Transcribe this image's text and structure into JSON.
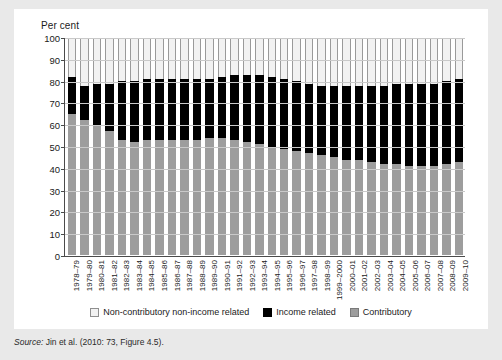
{
  "axis": {
    "y_title": "Per cent",
    "y_ticks": [
      100,
      90,
      80,
      70,
      60,
      50,
      40,
      30,
      20,
      10,
      0
    ]
  },
  "legend": {
    "items": [
      {
        "label": "Non-contributory non-income related",
        "swatch": "white",
        "color": "#f2f2f2"
      },
      {
        "label": "Income related",
        "swatch": "black",
        "color": "#000000"
      },
      {
        "label": "Contributory",
        "swatch": "grey",
        "color": "#9d9d9d"
      }
    ]
  },
  "source": {
    "prefix": "Source:",
    "text": " Jin et al. (2010: 73, Figure 4.5)."
  },
  "chart_data": {
    "type": "bar",
    "stacked": true,
    "title": "",
    "subtitle": "",
    "xlabel": "",
    "ylabel": "Per cent",
    "ylim": [
      0,
      100
    ],
    "grid": true,
    "legend_position": "bottom",
    "categories": [
      "1978–79",
      "1979–80",
      "1980–81",
      "1981–82",
      "1982–83",
      "1983–84",
      "1984–85",
      "1985–86",
      "1986–87",
      "1987–88",
      "1988–89",
      "1989–90",
      "1990–91",
      "1991–92",
      "1992–93",
      "1993–94",
      "1994–95",
      "1995–96",
      "1996–97",
      "1997–98",
      "1998–99",
      "1999–2000",
      "2000–01",
      "2001–02",
      "2002–03",
      "2003–04",
      "2004–05",
      "2005–06",
      "2006–07",
      "2007–08",
      "2008–09",
      "2009–10"
    ],
    "series": [
      {
        "name": "Contributory",
        "color": "#9d9d9d",
        "values": [
          65,
          62,
          60,
          57,
          53,
          52,
          53,
          53,
          53,
          53,
          53,
          54,
          54,
          53,
          52,
          51,
          50,
          49,
          48,
          47,
          46,
          45,
          44,
          44,
          43,
          42,
          42,
          41,
          41,
          41,
          42,
          43
        ]
      },
      {
        "name": "Income related",
        "color": "#000000",
        "values": [
          17,
          16,
          19,
          22,
          27,
          28,
          28,
          28,
          28,
          28,
          28,
          27,
          28,
          30,
          31,
          32,
          32,
          32,
          32,
          32,
          32,
          33,
          34,
          34,
          35,
          36,
          37,
          38,
          38,
          38,
          38,
          38
        ]
      },
      {
        "name": "Non-contributory non-income related",
        "color": "#f2f2f2",
        "values": [
          18,
          22,
          21,
          21,
          20,
          20,
          19,
          19,
          19,
          19,
          19,
          19,
          18,
          17,
          17,
          17,
          18,
          19,
          20,
          21,
          22,
          22,
          22,
          22,
          22,
          22,
          21,
          21,
          21,
          21,
          20,
          19
        ]
      }
    ]
  }
}
